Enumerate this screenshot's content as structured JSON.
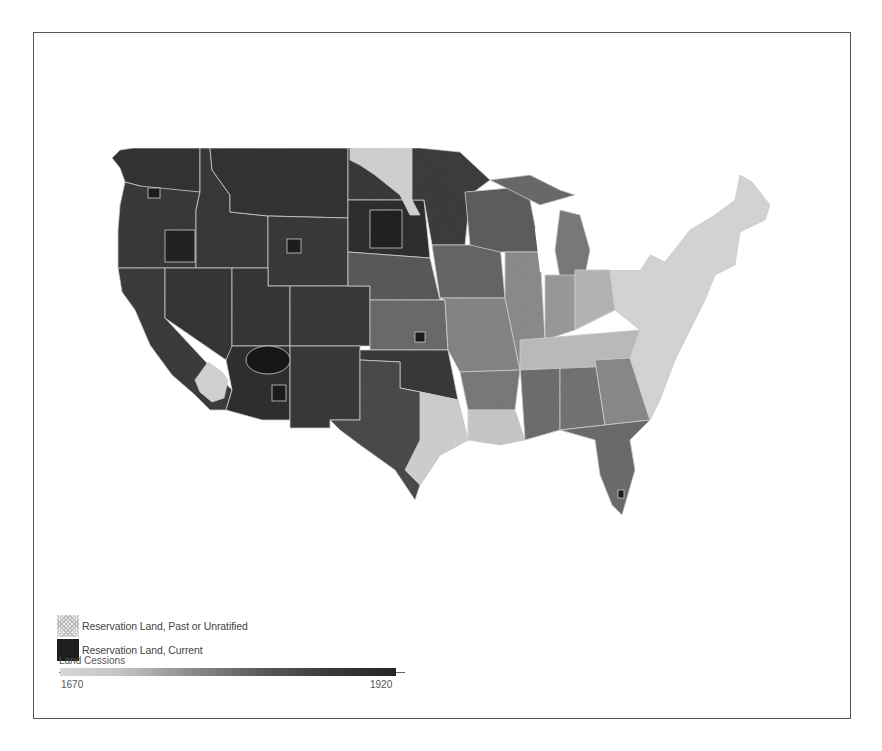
{
  "map": {
    "title": "",
    "subject": "Indian land cessions and reservations, contiguous United States",
    "colors": {
      "background": "#ffffff",
      "frame": "#555555",
      "state_border": "#d0d0d0",
      "early_cession": "#d4d4d4",
      "mid_cession": "#8c8c8c",
      "late_cession": "#3c3c3c",
      "reservation_current": "#1a1a1a"
    }
  },
  "legend": {
    "items": [
      {
        "label": "Reservation Land, Past or Unratified",
        "swatch": "past"
      },
      {
        "label": "Reservation Land, Current",
        "swatch": "current"
      }
    ],
    "scale_title": "Land Cessions",
    "scale_start": "1670",
    "scale_end": "1920"
  }
}
